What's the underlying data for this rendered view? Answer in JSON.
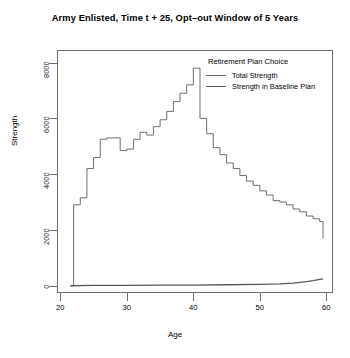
{
  "chart_data": {
    "type": "line",
    "title": "Army Enlisted, Time t + 25, Opt–out Window of 5 Years",
    "xlabel": "Age",
    "ylabel": "Strength",
    "xlim": [
      19.5,
      61.0
    ],
    "ylim": [
      -260,
      8450
    ],
    "xticks": [
      20,
      30,
      40,
      50,
      60
    ],
    "yticks": [
      0,
      2000,
      4000,
      6000,
      8000
    ],
    "xtick_labels": [
      "20",
      "30",
      "40",
      "50",
      "60"
    ],
    "ytick_labels": [
      "0",
      "2000",
      "4000",
      "6000",
      "8000"
    ],
    "grid": false,
    "legend_position": "top-right",
    "legend_title": "Retirement Plan Choice",
    "line_style": "step",
    "series": [
      {
        "name": "Total Strength",
        "color": "#6e6e6e",
        "x": [
          21.5,
          22,
          23,
          24,
          25,
          26,
          27,
          28,
          29,
          30,
          31,
          32,
          33,
          34,
          35,
          36,
          37,
          38,
          39,
          40,
          40.5,
          41,
          42,
          43,
          44,
          45,
          46,
          47,
          48,
          49,
          50,
          51,
          52,
          53,
          54,
          55,
          56,
          57,
          58,
          59,
          59.5
        ],
        "values": [
          0,
          2900,
          3150,
          4200,
          4600,
          5250,
          5300,
          5300,
          4850,
          4900,
          5250,
          5500,
          5400,
          5700,
          5950,
          6250,
          6600,
          6900,
          7200,
          7800,
          7800,
          6000,
          5450,
          4950,
          4700,
          4400,
          4200,
          3950,
          3750,
          3600,
          3400,
          3250,
          3050,
          3000,
          2900,
          2750,
          2650,
          2500,
          2400,
          2300,
          1700
        ]
      },
      {
        "name": "Strength in Baseline Plan",
        "color": "#595959",
        "x": [
          21.5,
          25,
          30,
          35,
          40,
          45,
          50,
          53,
          55,
          56,
          57,
          58,
          59,
          59.5
        ],
        "values": [
          0,
          10,
          15,
          20,
          25,
          35,
          50,
          70,
          95,
          120,
          150,
          185,
          230,
          250
        ]
      }
    ]
  },
  "axes": {
    "y_title": "Strength",
    "x_title": "Age"
  }
}
